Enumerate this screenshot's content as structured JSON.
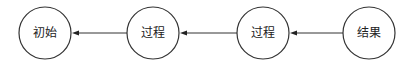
{
  "diagram": {
    "nodes": [
      {
        "id": "n1",
        "label": "初始"
      },
      {
        "id": "n2",
        "label": "过程"
      },
      {
        "id": "n3",
        "label": "过程"
      },
      {
        "id": "n4",
        "label": "结果"
      }
    ],
    "edges": [
      {
        "from": "n2",
        "to": "n1"
      },
      {
        "from": "n3",
        "to": "n2"
      },
      {
        "from": "n4",
        "to": "n3"
      }
    ],
    "colors": {
      "stroke": "#333333",
      "text": "#222222",
      "background": "#ffffff"
    }
  }
}
